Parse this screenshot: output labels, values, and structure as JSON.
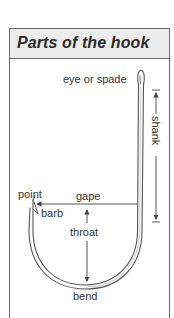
{
  "title": "Parts of the hook",
  "labels": {
    "eye": "eye or spade",
    "shank": "shank",
    "point": "point",
    "gape": "gape",
    "barb": "barb",
    "throat": "throat",
    "bend": "bend"
  },
  "colors": {
    "header_bg": "#ececec",
    "border": "#6d6d6d",
    "text": "#333333",
    "title": "#2b2b2b",
    "hook_stroke": "#555555"
  }
}
